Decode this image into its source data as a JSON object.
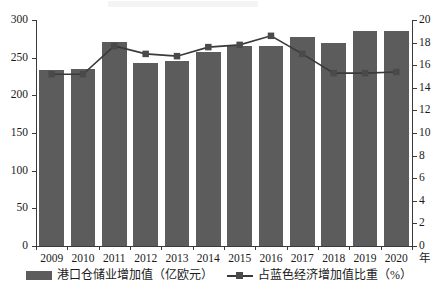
{
  "chart_data": {
    "type": "bar",
    "title": "",
    "subtitle": "",
    "xlabel": "年",
    "categories": [
      "2009",
      "2010",
      "2011",
      "2012",
      "2013",
      "2014",
      "2015",
      "2016",
      "2017",
      "2018",
      "2019",
      "2020"
    ],
    "grid": false,
    "legend_position": "bottom",
    "axes": {
      "left": {
        "label": "港口仓储业增加值（亿欧元）",
        "ylim": [
          0,
          300
        ],
        "ticks": [
          0,
          50,
          100,
          150,
          200,
          250,
          300
        ],
        "tick_labels": [
          "0",
          "50",
          "100",
          "150",
          "200",
          "250",
          "300"
        ]
      },
      "right": {
        "label": "占蓝色经济增加值比重（%）",
        "ylim": [
          0,
          20
        ],
        "ticks": [
          0,
          2,
          4,
          6,
          8,
          10,
          12,
          14,
          16,
          18,
          20
        ],
        "tick_labels": [
          "0",
          "2",
          "4",
          "6",
          "8",
          "10",
          "12",
          "14",
          "16",
          "18",
          "20"
        ]
      }
    },
    "series": [
      {
        "name": "港口仓储业增加值（亿欧元）",
        "type": "bar",
        "axis": "left",
        "color": "#5c5c5c",
        "values": [
          233,
          235,
          271,
          243,
          245,
          257,
          265,
          266,
          278,
          269,
          285,
          285
        ]
      },
      {
        "name": "占蓝色经济增加值比重（%）",
        "type": "line",
        "axis": "right",
        "color": "#3a3a3a",
        "marker": "square",
        "values": [
          15.2,
          15.2,
          17.7,
          17.0,
          16.8,
          17.6,
          17.8,
          18.6,
          17.0,
          15.3,
          15.3,
          15.4
        ]
      }
    ]
  },
  "legend": {
    "items": [
      {
        "label": "港口仓储业增加值（亿欧元）",
        "marker": "bar-swatch"
      },
      {
        "label": "占蓝色经济增加值比重（%）",
        "marker": "line-marker-swatch"
      }
    ]
  },
  "x_axis_unit": "年"
}
